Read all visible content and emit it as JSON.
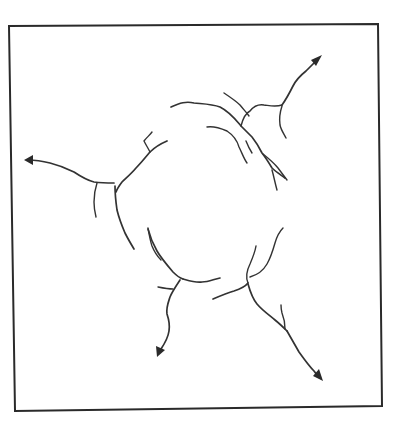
{
  "figure": {
    "frame": {
      "stroke_color": "#2a2a2a",
      "background": "#ffffff"
    },
    "crack_color": "#333333",
    "arrows": [
      {
        "id": "arrow-upper-right",
        "direction": "up-right"
      },
      {
        "id": "arrow-left",
        "direction": "left"
      },
      {
        "id": "arrow-lower-left",
        "direction": "down"
      },
      {
        "id": "arrow-lower-right",
        "direction": "down-right"
      }
    ]
  }
}
